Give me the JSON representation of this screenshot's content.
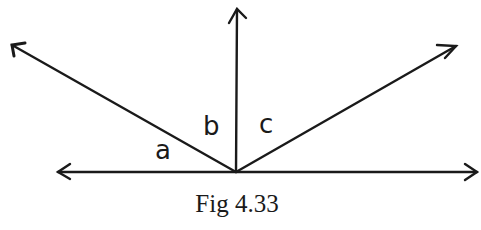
{
  "figure": {
    "caption": "Fig 4.33",
    "labels": {
      "a": "a",
      "b": "b",
      "c": "c"
    },
    "rays": [
      {
        "name": "left-horizontal",
        "from": [
          236,
          172
        ],
        "to": [
          58,
          172
        ]
      },
      {
        "name": "right-horizontal",
        "from": [
          236,
          172
        ],
        "to": [
          477,
          172
        ]
      },
      {
        "name": "vertical-up",
        "from": [
          236,
          172
        ],
        "to": [
          237,
          9
        ]
      },
      {
        "name": "upper-left",
        "from": [
          236,
          172
        ],
        "to": [
          12,
          45
        ]
      },
      {
        "name": "upper-right",
        "from": [
          236,
          172
        ],
        "to": [
          456,
          46
        ]
      }
    ],
    "stroke_color": "#1a1a1a"
  }
}
